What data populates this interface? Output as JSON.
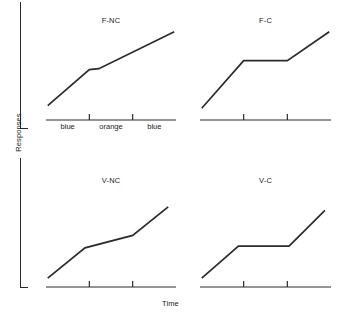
{
  "figure": {
    "ylabel": "Responses",
    "xlabel": "Time"
  },
  "chart_data": {
    "type": "line",
    "title": "",
    "xlabel": "Time",
    "ylabel": "Responses",
    "grid": false,
    "legend_position": "none",
    "axis_note": "Cumulative response records; y axis unlabeled (Responses), x axis unlabeled (Time). Two tick marks per panel divide each record into three components.",
    "shared_tick_labels": [
      "blue",
      "orange",
      "blue"
    ],
    "tick_labels_shown_on": "F-NC",
    "xlim": [
      0,
      3
    ],
    "ylim": [
      0,
      1
    ],
    "panels": [
      {
        "name": "F-NC",
        "title": "F-NC",
        "row": 1,
        "col": 1,
        "tick_labels": [
          "blue",
          "orange",
          "blue"
        ],
        "ticks_x": [
          1,
          2
        ],
        "x": [
          0.04,
          1.0,
          1.22,
          2.96
        ],
        "y": [
          0.16,
          0.56,
          0.57,
          0.98
        ],
        "description": "Steady constant-rate rise with a brief short plateau near the middle component."
      },
      {
        "name": "F-C",
        "title": "F-C",
        "row": 1,
        "col": 2,
        "tick_labels": [],
        "ticks_x": [
          1,
          2
        ],
        "x": [
          0.04,
          1.0,
          2.0,
          2.96
        ],
        "y": [
          0.13,
          0.66,
          0.66,
          0.98
        ],
        "description": "Rise, then a long flat plateau across the middle component, then rise resumes."
      },
      {
        "name": "V-NC",
        "title": "V-NC",
        "row": 2,
        "col": 1,
        "tick_labels": [],
        "ticks_x": [
          1,
          2
        ],
        "x": [
          0.04,
          0.9,
          2.0,
          2.82
        ],
        "y": [
          0.1,
          0.44,
          0.58,
          0.9
        ],
        "description": "Rise, shallow but non-zero slope across the middle component, then steeper rise."
      },
      {
        "name": "V-C",
        "title": "V-C",
        "row": 2,
        "col": 2,
        "tick_labels": [],
        "ticks_x": [
          1,
          2
        ],
        "x": [
          0.04,
          0.88,
          2.04,
          2.86
        ],
        "y": [
          0.1,
          0.46,
          0.46,
          0.86
        ],
        "description": "Rise, then a flat plateau across the middle component, then rise resumes."
      }
    ]
  },
  "colors": {
    "line": "#2b2b2b",
    "axis": "#2b2b2b",
    "text": "#1a1a1a",
    "background": "#ffffff"
  }
}
